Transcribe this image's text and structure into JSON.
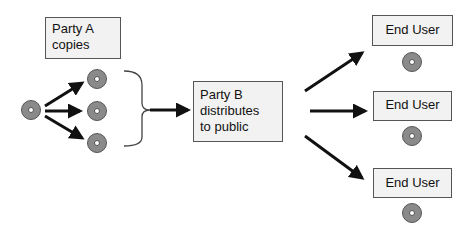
{
  "party_a": {
    "lines": [
      "Party A",
      "copies"
    ]
  },
  "party_b": {
    "lines": [
      "Party B",
      "distributes",
      "to public"
    ]
  },
  "end_users": [
    {
      "label": "End User"
    },
    {
      "label": "End User"
    },
    {
      "label": "End User"
    }
  ],
  "icons": {
    "disc": "disc-icon",
    "arrow": "arrow-icon",
    "brace": "brace-icon"
  }
}
